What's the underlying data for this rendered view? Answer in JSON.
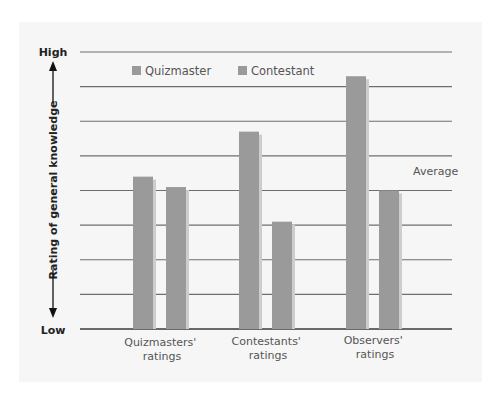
{
  "chart_data": {
    "type": "bar",
    "title": "",
    "xlabel": "",
    "ylabel": "Rating of general knowledge",
    "y_axis_ends": {
      "high": "High",
      "low": "Low"
    },
    "ylim": [
      0,
      8
    ],
    "grid": true,
    "gridline_count": 9,
    "legend_position": "top",
    "categories": [
      "Quizmasters' ratings",
      "Contestants' ratings",
      "Observers' ratings"
    ],
    "category_lines": [
      [
        "Quizmasters'",
        "ratings"
      ],
      [
        "Contestants'",
        "ratings"
      ],
      [
        "Observers'",
        "ratings"
      ]
    ],
    "series": [
      {
        "name": "Quizmaster",
        "values": [
          4.4,
          5.7,
          7.3
        ],
        "color": "#9a9a9a"
      },
      {
        "name": "Contestant",
        "values": [
          4.1,
          3.1,
          4.0
        ],
        "color": "#9a9a9a"
      }
    ],
    "annotations": [
      {
        "text": "Average",
        "near_gridline_value": 4.5
      }
    ]
  },
  "legend": {
    "items": [
      {
        "label": "Quizmaster"
      },
      {
        "label": "Contestant"
      }
    ]
  },
  "axis": {
    "high": "High",
    "low": "Low",
    "title": "Rating of general knowledge"
  },
  "annotation": {
    "average": "Average"
  },
  "colors": {
    "bar": "#9a9a9a",
    "bar_shadow": "#cdcdcd",
    "grid": "#6e6e6e",
    "panel": "#f6f6f6"
  }
}
